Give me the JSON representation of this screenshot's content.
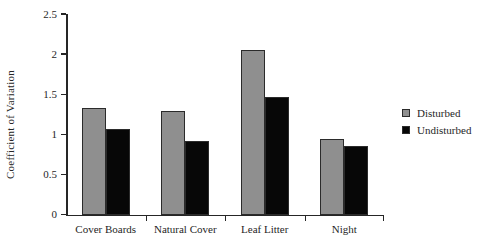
{
  "chart_data": {
    "type": "bar",
    "title": "",
    "xlabel": "",
    "ylabel": "Coefficient of Variation",
    "categories": [
      "Cover Boards",
      "Natural Cover",
      "Leaf Litter",
      "Night"
    ],
    "series": [
      {
        "name": "Disturbed",
        "color": "#8f8f8f",
        "values": [
          1.33,
          1.29,
          2.05,
          0.94
        ]
      },
      {
        "name": "Undisturbed",
        "color": "#070707",
        "values": [
          1.07,
          0.92,
          1.46,
          0.86
        ]
      }
    ],
    "ylim": [
      0,
      2.5
    ],
    "yticks": [
      0,
      0.5,
      1,
      1.5,
      2,
      2.5
    ],
    "ytick_labels": [
      "0",
      "0.5",
      "1",
      "1.5",
      "2",
      "2.5"
    ],
    "grid": false,
    "legend_position": "right"
  },
  "legend": {
    "entries": [
      {
        "label": "Disturbed"
      },
      {
        "label": "Undisturbed"
      }
    ]
  }
}
